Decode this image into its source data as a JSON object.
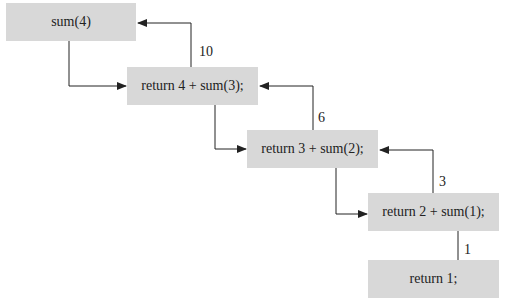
{
  "diagram": {
    "type": "recursion-trace",
    "boxes": [
      {
        "id": "call-sum4",
        "text": "sum(4)"
      },
      {
        "id": "call-sum3",
        "text": "return 4 + sum(3);"
      },
      {
        "id": "call-sum2",
        "text": "return 3 + sum(2);"
      },
      {
        "id": "call-sum1",
        "text": "return 2 + sum(1);"
      },
      {
        "id": "base-case",
        "text": "return 1;"
      }
    ],
    "return_values": [
      "10",
      "6",
      "3",
      "1"
    ],
    "edges": [
      {
        "from": "call-sum4",
        "to": "call-sum3",
        "kind": "call"
      },
      {
        "from": "call-sum3",
        "to": "call-sum2",
        "kind": "call"
      },
      {
        "from": "call-sum2",
        "to": "call-sum1",
        "kind": "call"
      },
      {
        "from": "call-sum3",
        "to": "call-sum4",
        "kind": "return",
        "value": "10"
      },
      {
        "from": "call-sum2",
        "to": "call-sum3",
        "kind": "return",
        "value": "6"
      },
      {
        "from": "call-sum1",
        "to": "call-sum2",
        "kind": "return",
        "value": "3"
      },
      {
        "from": "base-case",
        "to": "call-sum1",
        "kind": "return",
        "value": "1"
      }
    ],
    "colors": {
      "box_fill": "#d8d8d8",
      "line": "#222222"
    }
  }
}
